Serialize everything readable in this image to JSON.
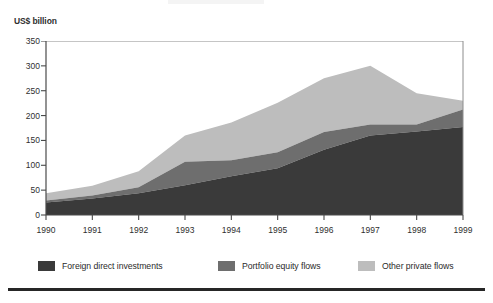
{
  "axis_unit_label": "US$ billion",
  "legend": {
    "entries": [
      {
        "label": "Foreign direct investments",
        "color": "#3a3a3a"
      },
      {
        "label": "Portfolio equity flows",
        "color": "#6e6e6e"
      },
      {
        "label": "Other private flows",
        "color": "#bdbdbd"
      }
    ]
  },
  "chart_data": {
    "type": "area",
    "stacked": true,
    "title": "",
    "subtitle": "",
    "xlabel": "",
    "ylabel": "US$ billion",
    "categories": [
      "1990",
      "1991",
      "1992",
      "1993",
      "1994",
      "1995",
      "1996",
      "1997",
      "1998",
      "1999"
    ],
    "x": [
      1990,
      1991,
      1992,
      1993,
      1994,
      1995,
      1996,
      1997,
      1998,
      1999
    ],
    "series": [
      {
        "name": "Foreign direct investments",
        "color": "#3a3a3a",
        "values": [
          25,
          33,
          44,
          60,
          78,
          94,
          131,
          160,
          168,
          177
        ]
      },
      {
        "name": "Portfolio equity flows",
        "color": "#6e6e6e",
        "values": [
          4,
          6,
          12,
          47,
          32,
          32,
          36,
          22,
          14,
          35
        ]
      },
      {
        "name": "Other private flows",
        "color": "#bdbdbd",
        "values": [
          15,
          20,
          32,
          53,
          76,
          100,
          108,
          118,
          63,
          18
        ]
      }
    ],
    "cumulative_totals": [
      44,
      59,
      88,
      160,
      186,
      226,
      275,
      300,
      245,
      230
    ],
    "ylim": [
      0,
      350
    ],
    "yticks": [
      0,
      50,
      100,
      150,
      200,
      250,
      300,
      350
    ],
    "ytick_labels": [
      "0",
      "50",
      "100",
      "150",
      "200",
      "250",
      "300",
      "350"
    ],
    "xticks": [
      1990,
      1991,
      1992,
      1993,
      1994,
      1995,
      1996,
      1997,
      1998,
      1999
    ],
    "grid": false,
    "legend_position": "bottom"
  }
}
